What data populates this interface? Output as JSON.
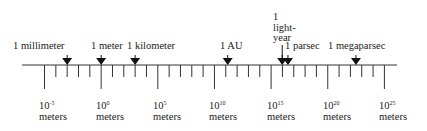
{
  "diagram": {
    "type": "logarithmic-scale",
    "unit_label": "meters",
    "axis": {
      "min_exp": -6,
      "max_exp": 27,
      "tick_every_exp": 1,
      "labeled_every_exp": 5
    },
    "powers": [
      {
        "base": "10",
        "exp": "-5",
        "unit": "meters"
      },
      {
        "base": "10",
        "exp": "0",
        "unit": "meters"
      },
      {
        "base": "10",
        "exp": "5",
        "unit": "meters"
      },
      {
        "base": "10",
        "exp": "10",
        "unit": "meters"
      },
      {
        "base": "10",
        "exp": "15",
        "unit": "meters"
      },
      {
        "base": "10",
        "exp": "20",
        "unit": "meters"
      },
      {
        "base": "10",
        "exp": "25",
        "unit": "meters"
      }
    ],
    "markers": [
      {
        "label": "1 millimeter",
        "log10": -3
      },
      {
        "label": "1 meter",
        "log10": 0
      },
      {
        "label": "1 kilometer",
        "log10": 3
      },
      {
        "label": "1 AU",
        "log10": 11.17
      },
      {
        "label_lines": [
          "1",
          "light-",
          "year"
        ],
        "log10": 15.98
      },
      {
        "label": "1 parsec",
        "log10": 16.49
      },
      {
        "label": "1 megaparsec",
        "log10": 22.49
      }
    ]
  }
}
